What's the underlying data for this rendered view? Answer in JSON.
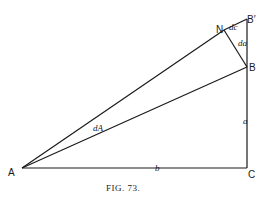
{
  "figure": {
    "caption": "FIG. 73.",
    "points": {
      "A": {
        "label": "A",
        "x": 22,
        "y": 168
      },
      "C": {
        "label": "C",
        "x": 247,
        "y": 168
      },
      "B": {
        "label": "B",
        "x": 247,
        "y": 67
      },
      "B_prime": {
        "label": "B′",
        "x": 247,
        "y": 19
      },
      "N": {
        "label": "N",
        "x": 224,
        "y": 30
      }
    },
    "edge_labels": {
      "b": "b",
      "a": "a",
      "dA": "dA",
      "dc": "dc",
      "da": "da"
    }
  }
}
